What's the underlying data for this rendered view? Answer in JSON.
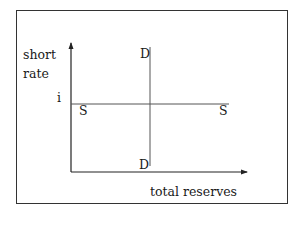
{
  "diagram": {
    "type": "supply-demand (reserves market)",
    "y_axis_label_line1": "short",
    "y_axis_label_line2": "rate",
    "x_axis_label": "total reserves",
    "rate_level_label": "i",
    "supply_curve": {
      "label_left": "S",
      "label_right": "S",
      "shape": "horizontal"
    },
    "demand_curve": {
      "label_top": "D",
      "label_bottom": "D",
      "shape": "vertical"
    }
  }
}
